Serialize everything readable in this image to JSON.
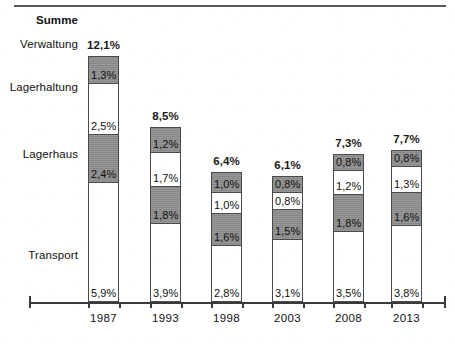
{
  "chart_data": {
    "type": "bar",
    "stacked": true,
    "title": "",
    "xlabel": "",
    "ylabel": "",
    "grid": false,
    "legend_position": "left-row-labels",
    "total_label": "Summe",
    "categories": [
      "1987",
      "1993",
      "1998",
      "2003",
      "2008",
      "2013"
    ],
    "series": [
      {
        "name": "Transport",
        "fill": "white",
        "values": [
          5.9,
          3.9,
          2.8,
          3.1,
          3.5,
          3.8
        ],
        "labels": [
          "5,9%",
          "3,9%",
          "2,8%",
          "3,1%",
          "3,5%",
          "3,8%"
        ]
      },
      {
        "name": "Lagerhaus",
        "fill": "gray",
        "values": [
          2.4,
          1.8,
          1.6,
          1.5,
          1.8,
          1.6
        ],
        "labels": [
          "2,4%",
          "1,8%",
          "1,6%",
          "1,5%",
          "1,8%",
          "1,6%"
        ]
      },
      {
        "name": "Lagerhaltung",
        "fill": "white",
        "values": [
          2.5,
          1.7,
          1.0,
          0.8,
          1.2,
          1.3
        ],
        "labels": [
          "2,5%",
          "1,7%",
          "1,0%",
          "0,8%",
          "1,2%",
          "1,3%"
        ]
      },
      {
        "name": "Verwaltung",
        "fill": "gray",
        "values": [
          1.3,
          1.2,
          1.0,
          0.8,
          0.8,
          0.8
        ],
        "labels": [
          "1,3%",
          "1,2%",
          "1,0%",
          "0,8%",
          "0,8%",
          "0,8%"
        ]
      }
    ],
    "totals": [
      12.1,
      8.5,
      6.4,
      6.1,
      7.3,
      7.7
    ],
    "total_labels": [
      "12,1%",
      "8,5%",
      "6,4%",
      "6,1%",
      "7,3%",
      "7,7%"
    ],
    "ylim": [
      0,
      12.1
    ],
    "value_unit": "%",
    "colors": {
      "gray_segment": "#8f8f8f",
      "white_segment": "#ffffff",
      "outline": "#4a4a4a",
      "text": "#111111",
      "axis": "#3a3a3a"
    }
  },
  "row_labels": [
    {
      "text": "Summe",
      "bold": true
    },
    {
      "text": "Verwaltung",
      "bold": false
    },
    {
      "text": "Lagerhaltung",
      "bold": false
    },
    {
      "text": "Lagerhaus",
      "bold": false
    },
    {
      "text": "Transport",
      "bold": false
    }
  ]
}
